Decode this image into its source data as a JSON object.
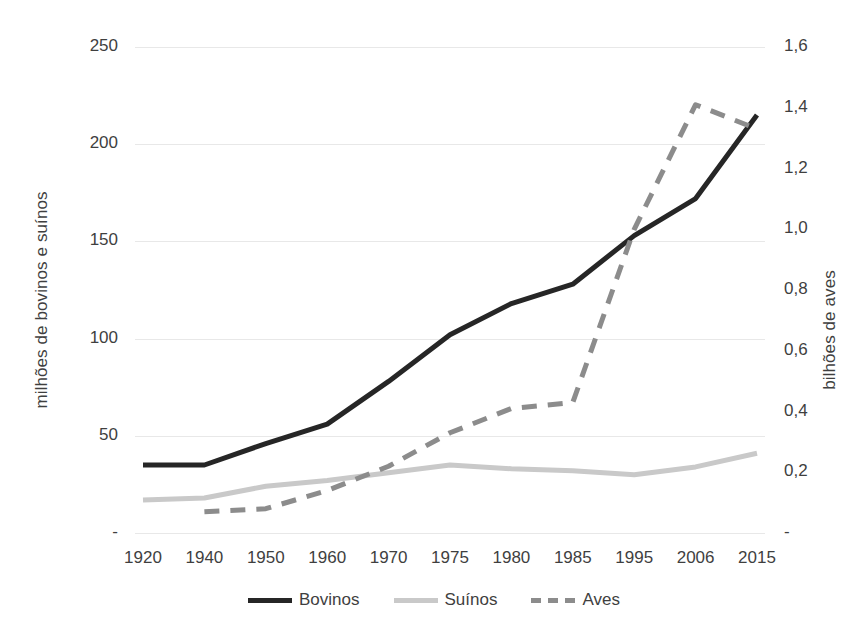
{
  "chart_data": {
    "type": "line",
    "title": "",
    "xlabel": "",
    "ylabel": "milhões de bovinos e suínos",
    "y2label": "bilhões de aves",
    "categories": [
      "1920",
      "1940",
      "1950",
      "1960",
      "1970",
      "1975",
      "1980",
      "1985",
      "1995",
      "2006",
      "2015"
    ],
    "xtick_labels": [
      "1920",
      "1940",
      "1950",
      "1960",
      "1970",
      "1975",
      "1980",
      "1985",
      "1995",
      "2006",
      "2015"
    ],
    "ylim": [
      0,
      250
    ],
    "ytick_labels": [
      "250",
      "200",
      "150",
      "100",
      "50",
      "-"
    ],
    "ytick_values": [
      250,
      200,
      150,
      100,
      50,
      0
    ],
    "y2lim": [
      0,
      1.6
    ],
    "y2tick_labels": [
      "1,6",
      "1,4",
      "1,2",
      "1,0",
      "0,8",
      "0,6",
      "0,4",
      "0,2",
      "-"
    ],
    "y2tick_values": [
      1.6,
      1.4,
      1.2,
      1.0,
      0.8,
      0.6,
      0.4,
      0.2,
      0
    ],
    "grid": true,
    "legend_position": "bottom",
    "series": [
      {
        "name": "Bovinos",
        "axis": "left",
        "style": "solid",
        "color": "#262626",
        "values": [
          35,
          35,
          46,
          56,
          78,
          102,
          118,
          128,
          153,
          172,
          215
        ]
      },
      {
        "name": "Suínos",
        "axis": "left",
        "style": "solid",
        "color": "#c9c9c9",
        "values": [
          17,
          18,
          24,
          27,
          31,
          35,
          33,
          32,
          30,
          34,
          41
        ]
      },
      {
        "name": "Aves",
        "axis": "right",
        "style": "dashed",
        "color": "#8c8c8c",
        "values": [
          null,
          0.07,
          0.08,
          0.14,
          0.22,
          0.33,
          0.41,
          0.43,
          1.0,
          1.41,
          1.33
        ]
      }
    ]
  },
  "legend": {
    "items": [
      {
        "label": "Bovinos"
      },
      {
        "label": "Suínos"
      },
      {
        "label": "Aves"
      }
    ]
  },
  "axes": {
    "left_title": "milhões de bovinos e suínos",
    "right_title": "bilhões de aves"
  }
}
